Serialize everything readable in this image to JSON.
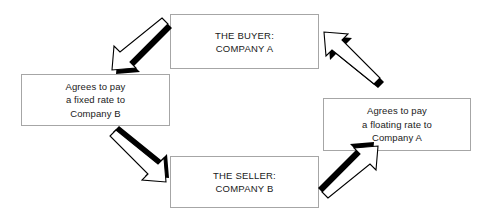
{
  "diagram": {
    "type": "cycle-flow",
    "background_color": "#ffffff",
    "box_border_color": "#a6a6a6",
    "arrow_fill_color": "#ffffff",
    "arrow_shadow_color": "#000000",
    "text_color": "#1a1a1a",
    "nodes": [
      {
        "id": "buyer",
        "role": "party",
        "lines": [
          "THE BUYER:",
          "COMPANY A"
        ],
        "line1": "THE BUYER:",
        "line2": "COMPANY A"
      },
      {
        "id": "fixed_leg",
        "role": "term",
        "lines": [
          "Agrees to pay",
          "a fixed rate to",
          "Company B"
        ],
        "line1": "Agrees to pay",
        "line2": "a fixed rate to",
        "line3": "Company B"
      },
      {
        "id": "floating_leg",
        "role": "term",
        "lines": [
          "Agrees to pay",
          "a floating rate to",
          "Company A"
        ],
        "line1": "Agrees to pay",
        "line2": "a floating rate to",
        "line3": "Company A"
      },
      {
        "id": "seller",
        "role": "party",
        "lines": [
          "THE SELLER:",
          "COMPANY B"
        ],
        "line1": "THE SELLER:",
        "line2": "COMPANY B"
      }
    ],
    "arrows": [
      {
        "id": "buyer-to-fixed",
        "from": "buyer",
        "to": "fixed_leg",
        "direction": "down-left",
        "style": "3d-block-arrow"
      },
      {
        "id": "fixed-to-seller",
        "from": "fixed_leg",
        "to": "seller",
        "direction": "down-right",
        "style": "3d-block-arrow"
      },
      {
        "id": "seller-to-floating",
        "from": "seller",
        "to": "floating_leg",
        "direction": "up-right",
        "style": "3d-block-arrow"
      },
      {
        "id": "floating-to-buyer",
        "from": "floating_leg",
        "to": "buyer",
        "direction": "up-left",
        "style": "3d-block-arrow"
      }
    ]
  }
}
